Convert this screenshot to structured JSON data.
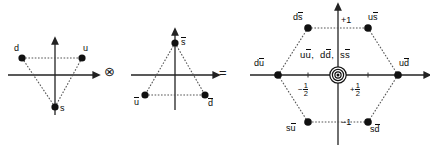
{
  "figure": {
    "type": "su3-meson-weight-diagram",
    "equation": "3 (x) 3bar = 8 + 1",
    "operators": {
      "tensor": "⊗",
      "equals": "="
    }
  },
  "panels": [
    {
      "id": "quark-triplet",
      "name": "quark-triplet-triangle",
      "center": [
        55,
        75
      ],
      "axes": {
        "horizontal": true,
        "vertical": true,
        "arrow_right": true,
        "arrow_up": true
      },
      "states": [
        {
          "name": "d",
          "label": "d",
          "x": 22,
          "y": 58,
          "label_dx": -8,
          "label_dy": -14
        },
        {
          "name": "u",
          "label": "u",
          "x": 82,
          "y": 58,
          "label_dx": 1,
          "label_dy": -14
        },
        {
          "name": "s",
          "label": "s",
          "x": 55,
          "y": 107,
          "label_dx": 5,
          "label_dy": -3
        }
      ],
      "connections": [
        [
          "d",
          "u"
        ],
        [
          "d",
          "s"
        ],
        [
          "u",
          "s"
        ]
      ]
    },
    {
      "id": "antiquark-triplet",
      "name": "antiquark-triplet-triangle",
      "center": [
        175,
        75
      ],
      "axes": {
        "horizontal": true,
        "vertical": true,
        "arrow_right": true,
        "arrow_up": true
      },
      "states": [
        {
          "name": "s-bar",
          "label": "s",
          "bar": true,
          "x": 175,
          "y": 43,
          "label_dx": 6,
          "label_dy": -5
        },
        {
          "name": "u-bar",
          "label": "u",
          "bar": true,
          "x": 145,
          "y": 95,
          "label_dx": -11,
          "label_dy": 3
        },
        {
          "name": "d-bar",
          "label": "d",
          "bar": true,
          "x": 205,
          "y": 95,
          "label_dx": 3,
          "label_dy": 4
        }
      ],
      "connections": [
        [
          "s-bar",
          "u-bar"
        ],
        [
          "s-bar",
          "d-bar"
        ],
        [
          "u-bar",
          "d-bar"
        ]
      ]
    },
    {
      "id": "meson-octet",
      "name": "meson-octet-hexagon",
      "center": [
        338,
        75
      ],
      "axes": {
        "horizontal": true,
        "vertical": true,
        "arrow_right": true,
        "arrow_up": true
      },
      "states": [
        {
          "name": "d-sbar",
          "label": "ds",
          "bar_on": "s",
          "x": 308,
          "y": 28,
          "label_dx": -13,
          "label_dy": -13
        },
        {
          "name": "u-sbar",
          "label": "us",
          "bar_on": "s",
          "x": 368,
          "y": 28,
          "label_dx": 2,
          "label_dy": -13
        },
        {
          "name": "d-ubar",
          "label": "du",
          "bar_on": "u",
          "x": 278,
          "y": 75,
          "label_dx": -22,
          "label_dy": -14
        },
        {
          "name": "u-dbar",
          "label": "ud",
          "bar_on": "d",
          "x": 398,
          "y": 75,
          "label_dx": 2,
          "label_dy": -14
        },
        {
          "name": "s-ubar",
          "label": "su",
          "bar_on": "u",
          "x": 308,
          "y": 122,
          "label_dx": -20,
          "label_dy": 1
        },
        {
          "name": "s-dbar",
          "label": "sd",
          "bar_on": "d",
          "x": 368,
          "y": 122,
          "label_dx": 3,
          "label_dy": 2
        }
      ],
      "center_state": {
        "name": "neutral-center-states",
        "parts": [
          "uu",
          "dd",
          "ss"
        ],
        "text": "uu,  dd,  ss",
        "marker": "concentric-circles",
        "multiplicity": 3
      },
      "connections": [
        [
          "d-sbar",
          "u-sbar"
        ],
        [
          "u-sbar",
          "u-dbar"
        ],
        [
          "u-dbar",
          "s-dbar"
        ],
        [
          "s-dbar",
          "s-ubar"
        ],
        [
          "s-ubar",
          "d-ubar"
        ],
        [
          "d-ubar",
          "d-sbar"
        ]
      ],
      "axis_ticks": [
        {
          "name": "tick-plus-one",
          "label": "+1",
          "axis": "vertical",
          "x": 344,
          "y": 21
        },
        {
          "name": "tick-minus-one",
          "label": "−1",
          "axis": "vertical",
          "x": 344,
          "y": 120
        },
        {
          "name": "tick-minus-half",
          "label": "−",
          "frac_num": "1",
          "frac_den": "2",
          "axis": "horizontal",
          "x": 303,
          "y": 82
        },
        {
          "name": "tick-plus-half",
          "label": "+",
          "frac_num": "1",
          "frac_den": "2",
          "axis": "horizontal",
          "x": 355,
          "y": 82
        }
      ]
    }
  ],
  "colors": {
    "ink": "#111111",
    "axis": "#2a2a2a",
    "dot": "#111111",
    "dashed": "#6a6a6a",
    "background": "#ffffff"
  }
}
